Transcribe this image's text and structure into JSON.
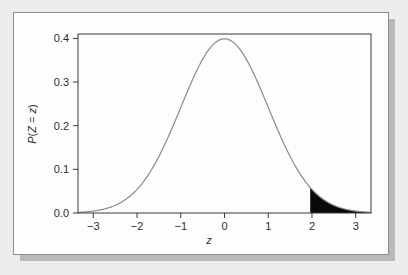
{
  "figure": {
    "background_color": "#fdfdfd",
    "page_background_color": "#ececeb",
    "border_color": "#8d8d8d",
    "shadow_color": "#b9b9b9"
  },
  "chart_data": {
    "type": "line",
    "title": "",
    "subtitle": "",
    "xlabel": "z",
    "ylabel": "P(Z = z)",
    "xlim": [
      -3.35,
      3.35
    ],
    "ylim": [
      0.0,
      0.41
    ],
    "grid": false,
    "legend": null,
    "curve_color": "#8a8a8a",
    "curve_width": 1.2,
    "axis_color": "#3a3a3a",
    "frame_color": "#3a3a3a",
    "xticks": [
      -3,
      -2,
      -1,
      0,
      1,
      2,
      3
    ],
    "xtick_labels": [
      "-3",
      "-2",
      "-1",
      "0",
      "1",
      "2",
      "3"
    ],
    "yticks": [
      0.0,
      0.1,
      0.2,
      0.3,
      0.4
    ],
    "ytick_labels": [
      "0.0",
      "0.1",
      "0.2",
      "0.3",
      "0.4"
    ],
    "series": [
      {
        "name": "standard normal density",
        "distribution": "normal",
        "mean": 0,
        "sd": 1,
        "x": [
          -3.35,
          -3.2,
          -3.0,
          -2.8,
          -2.6,
          -2.4,
          -2.2,
          -2.0,
          -1.8,
          -1.6,
          -1.4,
          -1.2,
          -1.0,
          -0.8,
          -0.6,
          -0.4,
          -0.2,
          0.0,
          0.2,
          0.4,
          0.6,
          0.8,
          1.0,
          1.2,
          1.4,
          1.6,
          1.8,
          2.0,
          2.2,
          2.4,
          2.6,
          2.8,
          3.0,
          3.2,
          3.35
        ],
        "y": [
          0.0015,
          0.0024,
          0.0044,
          0.0079,
          0.0136,
          0.0224,
          0.0355,
          0.054,
          0.079,
          0.1109,
          0.1497,
          0.1942,
          0.242,
          0.2897,
          0.3332,
          0.3683,
          0.391,
          0.3989,
          0.391,
          0.3683,
          0.3332,
          0.2897,
          0.242,
          0.1942,
          0.1497,
          0.1109,
          0.079,
          0.054,
          0.0355,
          0.0224,
          0.0136,
          0.0079,
          0.0044,
          0.0024,
          0.0015
        ]
      }
    ],
    "annotations": [
      {
        "type": "shaded-region",
        "name": "upper-tail-shaded-area",
        "fill_color": "#0a0a0a",
        "x_from": 1.96,
        "x_to": 3.35,
        "description": "black-filled upper tail area of the standard normal curve beginning just left of z = 2"
      }
    ]
  }
}
